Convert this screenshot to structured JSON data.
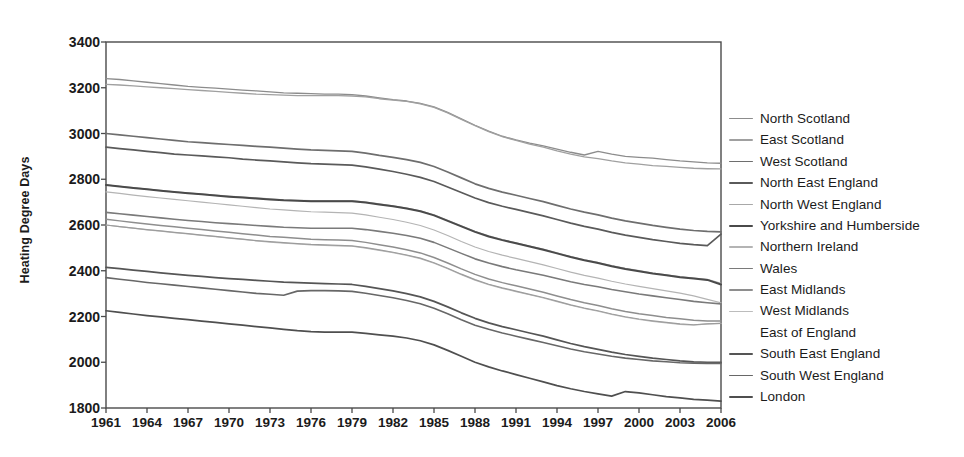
{
  "chart_data": {
    "type": "line",
    "title": "",
    "xlabel": "",
    "ylabel": "Heating Degree Days",
    "xlim": [
      1961,
      2006
    ],
    "ylim": [
      1800,
      3400
    ],
    "ytick_step": 200,
    "xtick_step": 3,
    "grid": false,
    "legend_position": "right",
    "ytick_labels": [
      "3400",
      "3200",
      "3000",
      "2800",
      "2600",
      "2400",
      "2200",
      "2000",
      "1800"
    ],
    "ytick_values": [
      3400,
      3200,
      3000,
      2800,
      2600,
      2400,
      2200,
      2000,
      1800
    ],
    "xtick_labels": [
      "1961",
      "1964",
      "1967",
      "1970",
      "1973",
      "1976",
      "1979",
      "1982",
      "1985",
      "1988",
      "1991",
      "1994",
      "1997",
      "2000",
      "2003",
      "2006"
    ],
    "xtick_values": [
      1961,
      1964,
      1967,
      1970,
      1973,
      1976,
      1979,
      1982,
      1985,
      1988,
      1991,
      1994,
      1997,
      2000,
      2003,
      2006
    ],
    "x": [
      1961,
      1962,
      1963,
      1964,
      1965,
      1966,
      1967,
      1968,
      1969,
      1970,
      1971,
      1972,
      1973,
      1974,
      1975,
      1976,
      1977,
      1978,
      1979,
      1980,
      1981,
      1982,
      1983,
      1984,
      1985,
      1986,
      1987,
      1988,
      1989,
      1990,
      1991,
      1992,
      1993,
      1994,
      1995,
      1996,
      1997,
      1998,
      1999,
      2000,
      2001,
      2002,
      2003,
      2004,
      2005,
      2006
    ],
    "series": [
      {
        "name": "North Scotland",
        "color": "#8c8c8c",
        "width": 1.3,
        "values": [
          3240,
          3236,
          3230,
          3224,
          3218,
          3212,
          3206,
          3202,
          3198,
          3194,
          3190,
          3186,
          3182,
          3178,
          3176,
          3174,
          3172,
          3172,
          3170,
          3164,
          3156,
          3148,
          3142,
          3132,
          3116,
          3092,
          3064,
          3036,
          3010,
          2988,
          2972,
          2958,
          2946,
          2932,
          2918,
          2906,
          2922,
          2910,
          2900,
          2896,
          2892,
          2886,
          2880,
          2876,
          2872,
          2870
        ]
      },
      {
        "name": "East Scotland",
        "color": "#a0a0a0",
        "width": 1.3,
        "values": [
          3215,
          3212,
          3208,
          3204,
          3200,
          3196,
          3192,
          3188,
          3184,
          3180,
          3176,
          3172,
          3170,
          3168,
          3166,
          3166,
          3166,
          3166,
          3164,
          3160,
          3152,
          3146,
          3140,
          3130,
          3114,
          3090,
          3062,
          3034,
          3008,
          2986,
          2970,
          2954,
          2940,
          2924,
          2910,
          2898,
          2890,
          2880,
          2872,
          2866,
          2860,
          2856,
          2852,
          2848,
          2846,
          2845
        ]
      },
      {
        "name": "West Scotland",
        "color": "#6e6e6e",
        "width": 1.7,
        "values": [
          3000,
          2994,
          2988,
          2982,
          2976,
          2970,
          2964,
          2960,
          2956,
          2952,
          2948,
          2944,
          2940,
          2936,
          2932,
          2928,
          2926,
          2924,
          2922,
          2914,
          2904,
          2896,
          2886,
          2874,
          2856,
          2832,
          2806,
          2780,
          2760,
          2744,
          2730,
          2716,
          2702,
          2686,
          2670,
          2656,
          2644,
          2630,
          2618,
          2608,
          2598,
          2590,
          2582,
          2576,
          2572,
          2570
        ]
      },
      {
        "name": "North East England",
        "color": "#5a5a5a",
        "width": 1.7,
        "values": [
          2940,
          2934,
          2928,
          2922,
          2916,
          2910,
          2906,
          2902,
          2898,
          2894,
          2888,
          2884,
          2880,
          2876,
          2872,
          2868,
          2866,
          2864,
          2862,
          2854,
          2844,
          2834,
          2822,
          2808,
          2790,
          2766,
          2742,
          2718,
          2698,
          2682,
          2668,
          2654,
          2640,
          2624,
          2608,
          2594,
          2582,
          2568,
          2556,
          2546,
          2536,
          2528,
          2520,
          2514,
          2510,
          2560
        ]
      },
      {
        "name": "North West England",
        "color": "#a8a8a8",
        "width": 1.3,
        "values": [
          2775,
          2769,
          2763,
          2757,
          2751,
          2745,
          2740,
          2735,
          2730,
          2726,
          2722,
          2718,
          2714,
          2710,
          2708,
          2706,
          2706,
          2706,
          2706,
          2700,
          2692,
          2684,
          2674,
          2662,
          2644,
          2620,
          2596,
          2572,
          2552,
          2536,
          2522,
          2508,
          2494,
          2478,
          2462,
          2448,
          2436,
          2422,
          2410,
          2400,
          2390,
          2382,
          2374,
          2368,
          2362,
          2345
        ]
      },
      {
        "name": "Yorkshire and Humberside",
        "color": "#4a4a4a",
        "width": 2.0,
        "values": [
          2775,
          2768,
          2762,
          2756,
          2750,
          2744,
          2739,
          2734,
          2729,
          2724,
          2720,
          2716,
          2712,
          2708,
          2706,
          2704,
          2704,
          2704,
          2704,
          2698,
          2690,
          2682,
          2672,
          2660,
          2642,
          2618,
          2594,
          2570,
          2550,
          2534,
          2520,
          2506,
          2492,
          2476,
          2460,
          2446,
          2434,
          2420,
          2408,
          2398,
          2388,
          2380,
          2372,
          2366,
          2360,
          2340
        ]
      },
      {
        "name": "Northern Ireland",
        "color": "#b4b4b4",
        "width": 1.2,
        "values": [
          2745,
          2738,
          2731,
          2724,
          2718,
          2712,
          2706,
          2700,
          2694,
          2688,
          2682,
          2676,
          2670,
          2666,
          2662,
          2658,
          2656,
          2654,
          2652,
          2644,
          2634,
          2624,
          2612,
          2598,
          2578,
          2554,
          2528,
          2504,
          2484,
          2468,
          2454,
          2440,
          2426,
          2410,
          2394,
          2380,
          2368,
          2354,
          2342,
          2332,
          2322,
          2312,
          2302,
          2290,
          2275,
          2260
        ]
      },
      {
        "name": "Wales",
        "color": "#7a7a7a",
        "width": 1.6,
        "values": [
          2655,
          2649,
          2643,
          2637,
          2631,
          2625,
          2620,
          2615,
          2610,
          2606,
          2602,
          2598,
          2594,
          2590,
          2588,
          2586,
          2586,
          2586,
          2586,
          2580,
          2572,
          2564,
          2554,
          2542,
          2524,
          2500,
          2476,
          2452,
          2434,
          2418,
          2404,
          2392,
          2380,
          2366,
          2352,
          2340,
          2330,
          2318,
          2308,
          2298,
          2290,
          2282,
          2274,
          2266,
          2260,
          2255
        ]
      },
      {
        "name": "East Midlands",
        "color": "#8e8e8e",
        "width": 1.5,
        "values": [
          2625,
          2618,
          2611,
          2604,
          2598,
          2592,
          2586,
          2580,
          2574,
          2568,
          2562,
          2556,
          2550,
          2546,
          2542,
          2538,
          2536,
          2534,
          2532,
          2524,
          2514,
          2504,
          2492,
          2478,
          2458,
          2434,
          2408,
          2384,
          2364,
          2348,
          2334,
          2320,
          2306,
          2290,
          2274,
          2260,
          2248,
          2234,
          2222,
          2212,
          2204,
          2196,
          2190,
          2184,
          2180,
          2180
        ]
      },
      {
        "name": "West Midlands",
        "color": "#bcbcbc",
        "width": 1.2,
        "values": [
          2600,
          2593,
          2586,
          2579,
          2573,
          2567,
          2561,
          2555,
          2549,
          2543,
          2537,
          2531,
          2525,
          2521,
          2517,
          2513,
          2511,
          2509,
          2507,
          2499,
          2489,
          2479,
          2467,
          2453,
          2433,
          2409,
          2383,
          2359,
          2339,
          2323,
          2309,
          2295,
          2281,
          2265,
          2249,
          2235,
          2223,
          2209,
          2197,
          2187,
          2179,
          2172,
          2166,
          2162,
          2168,
          2170
        ]
      },
      {
        "name": "East of England",
        "color": "#9c9c9c",
        "width": 1.2,
        "values": [
          2600,
          2593,
          2586,
          2580,
          2574,
          2568,
          2562,
          2556,
          2550,
          2544,
          2538,
          2532,
          2527,
          2523,
          2519,
          2515,
          2513,
          2511,
          2509,
          2501,
          2491,
          2481,
          2469,
          2455,
          2435,
          2411,
          2385,
          2361,
          2341,
          2325,
          2311,
          2297,
          2283,
          2267,
          2251,
          2237,
          2225,
          2211,
          2199,
          2189,
          2181,
          2174,
          2168,
          2164,
          2168,
          2170
        ]
      },
      {
        "name": "South East England",
        "color": "#555555",
        "width": 1.7,
        "values": [
          2415,
          2409,
          2403,
          2397,
          2391,
          2385,
          2380,
          2375,
          2370,
          2366,
          2362,
          2358,
          2354,
          2350,
          2348,
          2346,
          2344,
          2342,
          2340,
          2332,
          2322,
          2312,
          2300,
          2286,
          2266,
          2242,
          2216,
          2192,
          2172,
          2156,
          2142,
          2128,
          2114,
          2098,
          2082,
          2068,
          2056,
          2044,
          2034,
          2026,
          2018,
          2012,
          2006,
          2002,
          2000,
          2000
        ]
      },
      {
        "name": "South West England",
        "color": "#676767",
        "width": 1.6,
        "values": [
          2370,
          2363,
          2356,
          2349,
          2343,
          2337,
          2331,
          2325,
          2319,
          2313,
          2307,
          2301,
          2297,
          2293,
          2311,
          2313,
          2313,
          2312,
          2310,
          2302,
          2292,
          2282,
          2270,
          2256,
          2236,
          2212,
          2186,
          2162,
          2144,
          2128,
          2114,
          2100,
          2086,
          2072,
          2058,
          2046,
          2036,
          2026,
          2018,
          2012,
          2006,
          2002,
          1998,
          1996,
          1995,
          1995
        ]
      },
      {
        "name": "London",
        "color": "#4f4f4f",
        "width": 1.7,
        "values": [
          2225,
          2218,
          2211,
          2204,
          2198,
          2192,
          2186,
          2180,
          2174,
          2168,
          2162,
          2156,
          2150,
          2144,
          2138,
          2134,
          2132,
          2132,
          2132,
          2126,
          2120,
          2114,
          2106,
          2094,
          2076,
          2052,
          2026,
          2000,
          1980,
          1962,
          1946,
          1930,
          1914,
          1898,
          1884,
          1872,
          1862,
          1852,
          1872,
          1866,
          1858,
          1850,
          1844,
          1838,
          1834,
          1830
        ]
      }
    ]
  },
  "legend": {
    "items": [
      {
        "label": "North Scotland"
      },
      {
        "label": "East Scotland"
      },
      {
        "label": "West Scotland"
      },
      {
        "label": "North East England"
      },
      {
        "label": "North West England"
      },
      {
        "label": "Yorkshire and Humberside"
      },
      {
        "label": "Northern Ireland"
      },
      {
        "label": "Wales"
      },
      {
        "label": "East Midlands"
      },
      {
        "label": "West Midlands"
      },
      {
        "label": "East of England"
      },
      {
        "label": "South East England"
      },
      {
        "label": "South West England"
      },
      {
        "label": "London"
      }
    ]
  },
  "style": {
    "axis_color": "#4a4a4a",
    "text_color": "#1b1b1b",
    "background": "#ffffff"
  }
}
